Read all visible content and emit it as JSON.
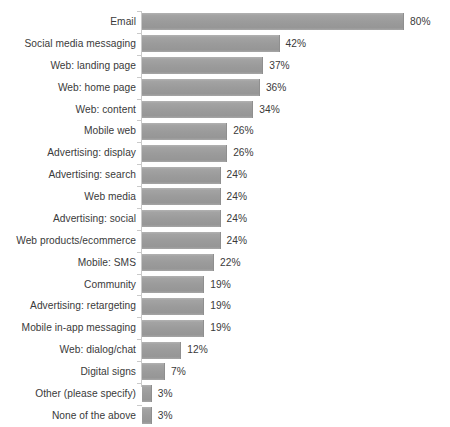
{
  "chart_data": {
    "type": "bar",
    "orientation": "horizontal",
    "title": "",
    "subtitle": "",
    "xlabel": "",
    "ylabel": "",
    "grid": false,
    "legend": false,
    "legend_position": "none",
    "xlim": [
      0,
      80
    ],
    "value_suffix": "%",
    "bar_color": "#9b9b9b",
    "text_color": "#3a3a3a",
    "axis_color": "#c9c9c9",
    "background": "#ffffff",
    "categories": [
      "Email",
      "Social media messaging",
      "Web: landing page",
      "Web: home page",
      "Web: content",
      "Mobile web",
      "Advertising: display",
      "Advertising: search",
      "Web media",
      "Advertising: social",
      "Web products/ecommerce",
      "Mobile: SMS",
      "Community",
      "Advertising: retargeting",
      "Mobile in-app messaging",
      "Web: dialog/chat",
      "Digital signs",
      "Other (please specify)",
      "None of the above"
    ],
    "values": [
      80,
      42,
      37,
      36,
      34,
      26,
      26,
      24,
      24,
      24,
      24,
      22,
      19,
      19,
      19,
      12,
      7,
      3,
      3
    ],
    "data_labels": [
      "80%",
      "42%",
      "37%",
      "36%",
      "34%",
      "26%",
      "26%",
      "24%",
      "24%",
      "24%",
      "24%",
      "22%",
      "19%",
      "19%",
      "19%",
      "12%",
      "7%",
      "3%",
      "3%"
    ]
  }
}
